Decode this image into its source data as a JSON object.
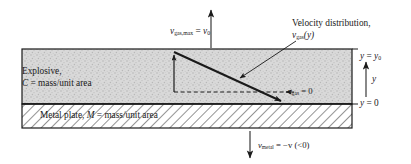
{
  "figure": {
    "name": "explosive-metal-plate-velocity-diagram",
    "width": 411,
    "height": 164,
    "background": "#ffffff",
    "colors": {
      "explosive_fill": "#d6d6d6",
      "metal_fill": "#ffffff",
      "line": "#1a1a1a",
      "text": "#1a1a1a"
    }
  },
  "labels": {
    "v_gas_max": {
      "v": "v",
      "sub": "gas,max",
      "eq": " = ",
      "v0": "v",
      "v0sub": "0"
    },
    "velocity_distribution_line1": "Velocity distribution,",
    "velocity_distribution_line2": {
      "v": "v",
      "sub": "gas",
      "arg": "(y)"
    },
    "explosive_line1": "Explosive,",
    "explosive_line2": {
      "c": "C",
      "rest": " = mass/unit area"
    },
    "v_gas_zero": {
      "arrow": "→",
      "v": "v",
      "sub": "gas",
      "rest": " = 0"
    },
    "metal_plate": {
      "pre": "Metal plate, ",
      "m": "M",
      "rest": " = mass/unit area"
    },
    "y_equals_y0": {
      "y": "y",
      "eq": " = ",
      "y0": "y",
      "y0sub": "0"
    },
    "y_axis": "y",
    "y_equals_0": {
      "y": "y",
      "rest": " = 0"
    },
    "v_metal": {
      "v": "v",
      "sub": "metal",
      "rest": " = −v (<0)"
    }
  },
  "geometry": {
    "box_left": 22,
    "box_right": 352,
    "box_top": 49,
    "interface_y": 104,
    "box_bottom": 128,
    "profile_top_x": 174,
    "profile_top_y": 52,
    "profile_bottom_x": 283,
    "dashed_y": 92,
    "dashed_x_start": 174,
    "dashed_x_end": 292,
    "top_arrow_x": 211,
    "top_arrow_tip_y": 8,
    "bottom_arrow_x": 250,
    "bottom_arrow_tip_y": 160
  },
  "annotations": {
    "regions": [
      {
        "name": "explosive-region",
        "label": "Explosive, C = mass/unit area"
      },
      {
        "name": "metal-plate-region",
        "label": "Metal plate, M = mass/unit area"
      }
    ],
    "arrows": [
      {
        "name": "v-gas-max-arrow",
        "direction": "up"
      },
      {
        "name": "v-metal-arrow",
        "direction": "down"
      },
      {
        "name": "y-axis-arrow",
        "direction": "up"
      },
      {
        "name": "velocity-profile-arrow",
        "direction": "down-right"
      },
      {
        "name": "leader-line-velocity-distribution",
        "direction": "down-left"
      },
      {
        "name": "v-gas-zero-pointer",
        "direction": "left"
      }
    ]
  }
}
